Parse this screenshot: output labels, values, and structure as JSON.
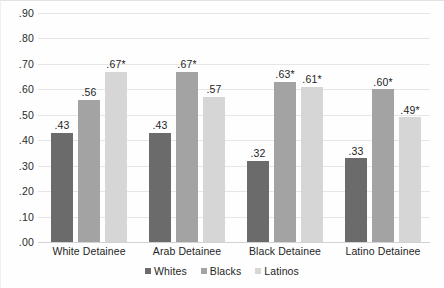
{
  "chart_data": {
    "type": "bar",
    "title": "",
    "subtitle": "",
    "xlabel": "",
    "ylabel": "",
    "ylim": [
      0.0,
      0.9
    ],
    "grid": true,
    "legend_position": "bottom-center",
    "categories": [
      "White Detainee",
      "Arab Detainee",
      "Black Detainee",
      "Latino Detainee"
    ],
    "ytick_labels": [
      ".90",
      ".80",
      ".70",
      ".60",
      ".50",
      ".40",
      ".30",
      ".20",
      ".10",
      ".00"
    ],
    "ytick_values": [
      0.9,
      0.8,
      0.7,
      0.6,
      0.5,
      0.4,
      0.3,
      0.2,
      0.1,
      0.0
    ],
    "series": [
      {
        "name": "Whites",
        "color": "#6b6b6b",
        "values": [
          0.43,
          0.43,
          0.32,
          0.33
        ],
        "labels": [
          ".43",
          ".43",
          ".32",
          ".33"
        ]
      },
      {
        "name": "Blacks",
        "color": "#a3a3a3",
        "values": [
          0.56,
          0.67,
          0.63,
          0.6
        ],
        "labels": [
          ".56",
          ".67*",
          ".63*",
          ".60*"
        ]
      },
      {
        "name": "Latinos",
        "color": "#d6d6d6",
        "values": [
          0.67,
          0.57,
          0.61,
          0.49
        ],
        "labels": [
          ".67*",
          ".57",
          ".61*",
          ".49*"
        ]
      }
    ],
    "annotations": {
      "asterisk_note": "* denotes statistical significance"
    }
  },
  "legend": {
    "items": [
      {
        "label": "Whites",
        "color": "#6b6b6b"
      },
      {
        "label": "Blacks",
        "color": "#a3a3a3"
      },
      {
        "label": "Latinos",
        "color": "#d6d6d6"
      }
    ]
  }
}
